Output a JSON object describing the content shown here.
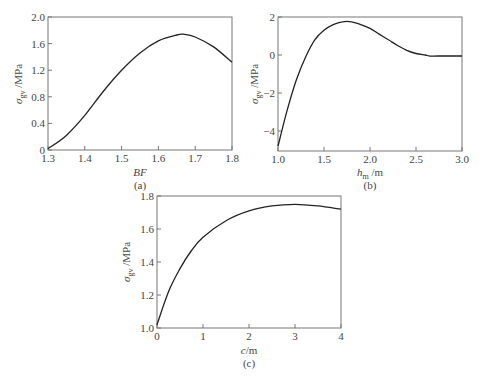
{
  "chart_data": [
    {
      "id": "a",
      "type": "line",
      "title": "",
      "caption": "(a)",
      "xlabel": "BF",
      "ylabel": "σgv /MPa",
      "xlim": [
        1.3,
        1.8
      ],
      "ylim": [
        0,
        2.0
      ],
      "xticks": [
        "1.3",
        "1.4",
        "1.5",
        "1.6",
        "1.7",
        "1.8"
      ],
      "yticks": [
        "0",
        "0.4",
        "0.8",
        "1.2",
        "1.6",
        "2.0"
      ],
      "grid": false,
      "series": [
        {
          "name": "σgv",
          "x": [
            1.3,
            1.35,
            1.4,
            1.45,
            1.5,
            1.55,
            1.6,
            1.65,
            1.67,
            1.7,
            1.75,
            1.8
          ],
          "values": [
            0.02,
            0.22,
            0.52,
            0.88,
            1.2,
            1.46,
            1.64,
            1.73,
            1.74,
            1.7,
            1.55,
            1.32
          ]
        }
      ]
    },
    {
      "id": "b",
      "type": "line",
      "title": "",
      "caption": "(b)",
      "xlabel": "hm /m",
      "ylabel": "σgv /MPa",
      "xlim": [
        1.0,
        3.0
      ],
      "ylim": [
        -5.05,
        2
      ],
      "xticks": [
        "1.0",
        "1.5",
        "2.0",
        "2.5",
        "3.0"
      ],
      "yticks": [
        "−4",
        "−2",
        "0",
        "2"
      ],
      "grid": false,
      "series": [
        {
          "name": "σgv",
          "x": [
            1.0,
            1.1,
            1.2,
            1.3,
            1.4,
            1.5,
            1.6,
            1.7,
            1.8,
            1.9,
            2.0,
            2.1,
            2.2,
            2.3,
            2.4,
            2.5,
            2.6,
            2.65,
            2.8,
            3.0
          ],
          "values": [
            -4.8,
            -2.9,
            -1.3,
            -0.1,
            0.8,
            1.3,
            1.6,
            1.75,
            1.75,
            1.6,
            1.4,
            1.1,
            0.8,
            0.5,
            0.25,
            0.08,
            0.0,
            -0.05,
            -0.05,
            -0.05
          ]
        }
      ]
    },
    {
      "id": "c",
      "type": "line",
      "title": "",
      "caption": "(c)",
      "xlabel": "c/m",
      "ylabel": "σgv /MPa",
      "xlim": [
        0,
        4
      ],
      "ylim": [
        1.0,
        1.8
      ],
      "xticks": [
        "0",
        "1",
        "2",
        "3",
        "4"
      ],
      "yticks": [
        "1.0",
        "1.2",
        "1.4",
        "1.6",
        "1.8"
      ],
      "grid": false,
      "series": [
        {
          "name": "σgv",
          "x": [
            0,
            0.25,
            0.5,
            0.75,
            1,
            1.5,
            2,
            2.5,
            3,
            3.5,
            4
          ],
          "values": [
            1.02,
            1.22,
            1.36,
            1.47,
            1.55,
            1.65,
            1.71,
            1.74,
            1.75,
            1.74,
            1.72
          ]
        }
      ]
    }
  ],
  "labels": {
    "a": {
      "xlabel_main": "BF",
      "caption": "(a)",
      "ylabel_sigma": "σ",
      "ylabel_sub": "gv",
      "ylabel_unit": " /MPa"
    },
    "b": {
      "xlabel_main": "h",
      "xlabel_sub": "m",
      "xlabel_unit": " /m",
      "caption": "(b)",
      "ylabel_sigma": "σ",
      "ylabel_sub": "gv",
      "ylabel_unit": " /MPa"
    },
    "c": {
      "xlabel_main": "c",
      "xlabel_unit": "/m",
      "caption": "(c)",
      "ylabel_sigma": "σ",
      "ylabel_sub": "gv",
      "ylabel_unit": " /MPa"
    }
  },
  "colors": {
    "curve": "#222222",
    "frame": "#777777",
    "text": "#444444"
  }
}
